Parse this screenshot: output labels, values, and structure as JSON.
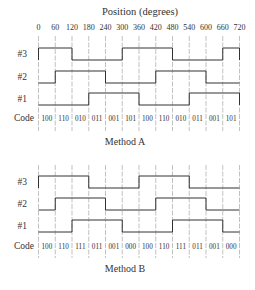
{
  "axis_title": "Position (degrees)",
  "ticks": [
    "0",
    "60",
    "120",
    "180",
    "240",
    "300",
    "360",
    "420",
    "480",
    "540",
    "600",
    "660",
    "720"
  ],
  "diagrams": [
    {
      "caption": "Method A",
      "channels": [
        {
          "label": "#3",
          "levels": [
            1,
            1,
            0,
            0,
            0,
            1,
            1,
            1,
            0,
            0,
            0,
            1
          ]
        },
        {
          "label": "#2",
          "levels": [
            0,
            1,
            1,
            1,
            0,
            0,
            0,
            1,
            1,
            1,
            0,
            0
          ]
        },
        {
          "label": "#1",
          "levels": [
            0,
            0,
            0,
            1,
            1,
            1,
            0,
            0,
            0,
            1,
            1,
            1
          ]
        }
      ],
      "code_label": "Code",
      "codes": [
        "100",
        "110",
        "010",
        "011",
        "001",
        "101",
        "100",
        "110",
        "010",
        "011",
        "001",
        "101"
      ]
    },
    {
      "caption": "Method B",
      "channels": [
        {
          "label": "#3",
          "levels": [
            1,
            1,
            1,
            0,
            0,
            0,
            1,
            1,
            1,
            0,
            0,
            0
          ]
        },
        {
          "label": "#2",
          "levels": [
            0,
            1,
            1,
            1,
            0,
            0,
            0,
            1,
            1,
            1,
            0,
            0
          ]
        },
        {
          "label": "#1",
          "levels": [
            0,
            0,
            1,
            1,
            1,
            0,
            0,
            0,
            1,
            1,
            1,
            0
          ]
        }
      ],
      "code_label": "Code",
      "codes": [
        "100",
        "110",
        "111",
        "011",
        "001",
        "000",
        "100",
        "110",
        "111",
        "011",
        "001",
        "000"
      ]
    }
  ],
  "colors": {
    "line": "#333333",
    "grid": "#999999",
    "text": "#333333"
  }
}
